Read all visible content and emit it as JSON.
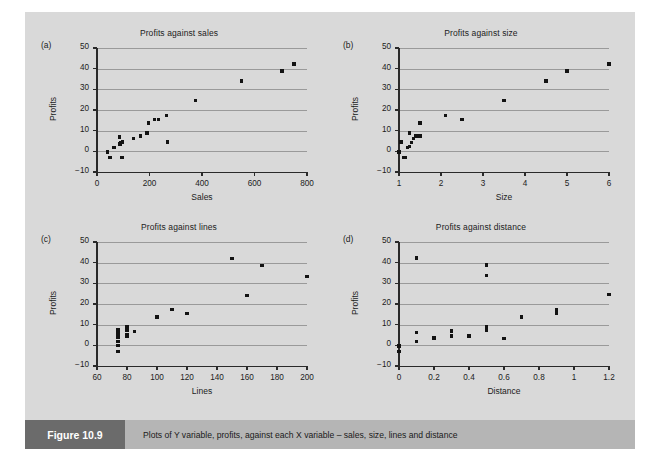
{
  "figure": {
    "number_label": "Figure 10.9",
    "caption": "Plots of Y variable, profits, against each X variable – sales, size, lines and distance",
    "background_color": "#d9d9d9",
    "caption_bar_color": "#b5b5b5",
    "caption_tag_color": "#6b6b6b",
    "point_color": "#131313",
    "gridline_color": "#9a9a9a"
  },
  "chart_data": [
    {
      "type": "scatter",
      "panel": "(a)",
      "title": "Profits against sales",
      "xlabel": "Sales",
      "ylabel": "Profits",
      "xlim": [
        0,
        800
      ],
      "ylim": [
        -10,
        50
      ],
      "xticks": [
        0,
        200,
        400,
        600,
        800
      ],
      "yticks": [
        -10,
        0,
        10,
        20,
        30,
        40,
        50
      ],
      "grid": "horizontal",
      "legend": "none",
      "x": [
        40,
        50,
        65,
        85,
        88,
        90,
        92,
        95,
        98,
        140,
        165,
        190,
        195,
        220,
        235,
        265,
        268,
        375,
        550,
        705,
        750
      ],
      "y": [
        -0.3,
        -3.0,
        2.0,
        7.0,
        3.5,
        4.0,
        4.3,
        -3.0,
        4.6,
        6.3,
        7.5,
        8.8,
        13.7,
        15.4,
        15.4,
        17.2,
        4.5,
        24.5,
        34.0,
        38.8,
        42.2
      ]
    },
    {
      "type": "scatter",
      "panel": "(b)",
      "title": "Profits against size",
      "xlabel": "Size",
      "ylabel": "Profits",
      "xlim": [
        1,
        6
      ],
      "ylim": [
        -10,
        50
      ],
      "xticks": [
        1,
        2,
        3,
        4,
        5,
        6
      ],
      "yticks": [
        -10,
        0,
        10,
        20,
        30,
        40,
        50
      ],
      "grid": "horizontal",
      "legend": "none",
      "x": [
        1.0,
        1.05,
        1.1,
        1.15,
        1.2,
        1.25,
        1.25,
        1.3,
        1.35,
        1.4,
        1.45,
        1.5,
        1.5,
        2.1,
        2.5,
        3.5,
        4.5,
        5.0,
        6.0
      ],
      "y": [
        -0.3,
        4.5,
        -3.0,
        -3.0,
        2.0,
        2.2,
        8.8,
        4.3,
        6.3,
        7.5,
        7.2,
        7.5,
        13.7,
        17.4,
        15.4,
        24.5,
        34.0,
        38.8,
        42.2
      ]
    },
    {
      "type": "scatter",
      "panel": "(c)",
      "title": "Profits against lines",
      "xlabel": "Lines",
      "ylabel": "Profits",
      "xlim": [
        60,
        200
      ],
      "ylim": [
        -10,
        50
      ],
      "xticks": [
        60,
        80,
        100,
        120,
        140,
        160,
        180,
        200
      ],
      "yticks": [
        -10,
        0,
        10,
        20,
        30,
        40,
        50
      ],
      "grid": "horizontal",
      "legend": "none",
      "x": [
        74,
        74,
        74,
        74,
        74,
        74,
        74,
        80,
        80,
        80,
        80,
        85,
        100,
        110,
        120,
        150,
        160,
        170,
        200
      ],
      "y": [
        -3.0,
        0.0,
        2.0,
        4.0,
        4.6,
        6.3,
        7.5,
        4.6,
        5.3,
        7.5,
        8.8,
        6.8,
        13.7,
        17.2,
        15.4,
        42.0,
        24.2,
        38.5,
        33.2
      ]
    },
    {
      "type": "scatter",
      "panel": "(d)",
      "title": "Profits against distance",
      "xlabel": "Distance",
      "ylabel": "Profits",
      "xlim": [
        0,
        1.2
      ],
      "ylim": [
        -10,
        50
      ],
      "xticks": [
        0,
        0.2,
        0.4,
        0.6,
        0.8,
        1.0,
        1.2
      ],
      "xticklabels": [
        "0",
        "0.2",
        "0.4",
        "0.6",
        "0.8",
        "1",
        "1.2"
      ],
      "yticks": [
        -10,
        0,
        10,
        20,
        30,
        40,
        50
      ],
      "grid": "horizontal",
      "legend": "none",
      "x": [
        0.0,
        0.0,
        0.1,
        0.1,
        0.1,
        0.2,
        0.3,
        0.3,
        0.4,
        0.5,
        0.5,
        0.5,
        0.5,
        0.6,
        0.7,
        0.9,
        0.9,
        1.2
      ],
      "y": [
        -0.3,
        -3.0,
        42.2,
        6.3,
        2.0,
        3.5,
        7.0,
        4.5,
        4.5,
        38.8,
        33.8,
        8.8,
        7.5,
        3.3,
        13.7,
        17.2,
        15.6,
        24.5
      ]
    }
  ]
}
